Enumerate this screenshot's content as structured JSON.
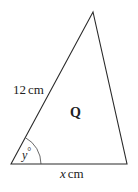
{
  "diagram": {
    "shape": "triangle",
    "name_label": "Q",
    "side_left_label": "12 cm",
    "side_left_value": "12",
    "side_left_unit": "cm",
    "side_base_variable": "x",
    "side_base_unit": "cm",
    "angle_variable": "y",
    "angle_unit": "°",
    "colors": {
      "stroke": "#2a2a2a",
      "text": "#222222",
      "background": "#ffffff"
    }
  }
}
